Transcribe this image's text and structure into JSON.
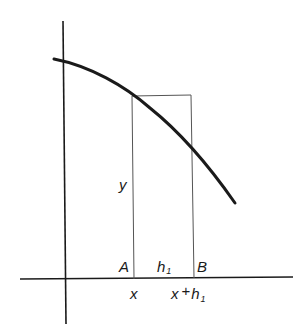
{
  "figure": {
    "colors": {
      "background": "#ffffff",
      "ink": "#1a1a1a",
      "thin_line": "#555555"
    },
    "labels": {
      "y": "y",
      "point_a": "A",
      "point_b": "B",
      "width_main": "h",
      "width_sub": "1",
      "x_left": "x",
      "x_right_main": "x",
      "x_right_plus": "+",
      "x_right_h": "h",
      "x_right_sub": "1"
    },
    "geometry": {
      "y_axis": {
        "x1": 63,
        "y1": 21,
        "x2": 67,
        "y2": 324
      },
      "x_axis": {
        "x1": 20,
        "y1": 279,
        "x2": 293,
        "y2": 277
      },
      "curve_path": "M 54 59 Q 150 75 235 203",
      "rectangle": {
        "left": 132,
        "right": 192,
        "top": 95,
        "bottom": 279
      }
    }
  }
}
